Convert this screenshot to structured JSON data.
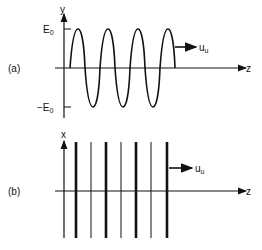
{
  "panel_a": {
    "label": "(a)",
    "y_axis_label": "y",
    "z_axis_label": "z",
    "pos_amp_label": "E",
    "pos_amp_sub": "0",
    "neg_amp_label": "−E",
    "neg_amp_sub": "0",
    "velocity_label": "u",
    "velocity_sub": "u"
  },
  "panel_b": {
    "label": "(b)",
    "x_axis_label": "x",
    "z_axis_label": "z",
    "velocity_label": "u",
    "velocity_sub": "u"
  }
}
